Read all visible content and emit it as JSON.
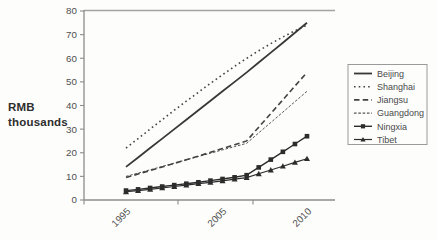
{
  "chart_data": {
    "type": "line",
    "title": "",
    "ylabel_lines": [
      "RMB",
      "thousands"
    ],
    "xlabel": "",
    "ylim": [
      0,
      80
    ],
    "y_ticks": [
      0,
      10,
      20,
      30,
      40,
      50,
      60,
      70,
      80
    ],
    "x": [
      1995,
      1996,
      1997,
      1998,
      1999,
      2000,
      2001,
      2002,
      2003,
      2004,
      2005,
      2006,
      2007,
      2008,
      2009,
      2010
    ],
    "x_tick_labels": [
      "1995",
      "2005",
      "2010"
    ],
    "grid": false,
    "legend_position": "right",
    "colors": {
      "ink": "#3a3a3a",
      "axis": "#8c8c8c",
      "top_border": "#a3a3a3",
      "tick_text": "#4f4f4f",
      "legend_border": "#9a9a9a",
      "legend_text": "#4a4a4a",
      "background": "#fdfdfc"
    },
    "series": [
      {
        "name": "Beijing",
        "line_style": "solid",
        "marker": "none",
        "width": 1.8,
        "color": "#383838",
        "values": [
          14,
          18,
          22,
          26,
          30,
          34,
          38,
          42,
          46,
          50,
          54,
          58.2,
          62.4,
          66.6,
          70.8,
          75
        ]
      },
      {
        "name": "Shanghai",
        "line_style": "dotted",
        "marker": "none",
        "width": 1.6,
        "color": "#454545",
        "values": [
          22,
          26,
          30,
          34,
          38,
          41.8,
          45.6,
          49.4,
          53,
          56.6,
          60,
          63.2,
          66.2,
          69,
          71.6,
          74
        ]
      },
      {
        "name": "Jiangsu",
        "line_style": "dashed",
        "marker": "none",
        "width": 1.6,
        "color": "#424242",
        "values": [
          9.5,
          11,
          12.5,
          14,
          15.5,
          17,
          18.6,
          20.2,
          21.8,
          23.4,
          25,
          30.8,
          36.6,
          42.4,
          48.2,
          54
        ]
      },
      {
        "name": "Guangdong",
        "line_style": "fine-dashed",
        "marker": "none",
        "width": 1.0,
        "color": "#555555",
        "values": [
          10,
          11.4,
          12.8,
          14.2,
          15.6,
          17,
          18.4,
          19.8,
          21.2,
          22.6,
          24,
          28.4,
          32.8,
          37.2,
          41.6,
          46
        ]
      },
      {
        "name": "Ningxia",
        "line_style": "solid",
        "marker": "square",
        "width": 1.4,
        "color": "#2c2c2c",
        "values": [
          4,
          4.5,
          5.1,
          5.7,
          6.3,
          6.9,
          7.5,
          8.2,
          8.9,
          9.6,
          10.5,
          13.8,
          17.1,
          20.4,
          23.7,
          27
        ]
      },
      {
        "name": "Tibet",
        "line_style": "solid",
        "marker": "triangle",
        "width": 1.2,
        "color": "#2c2c2c",
        "values": [
          3.5,
          4,
          4.5,
          5.1,
          5.7,
          6.3,
          6.9,
          7.5,
          8.1,
          8.8,
          9.5,
          11.1,
          12.7,
          14.3,
          15.9,
          17.5
        ]
      }
    ]
  }
}
